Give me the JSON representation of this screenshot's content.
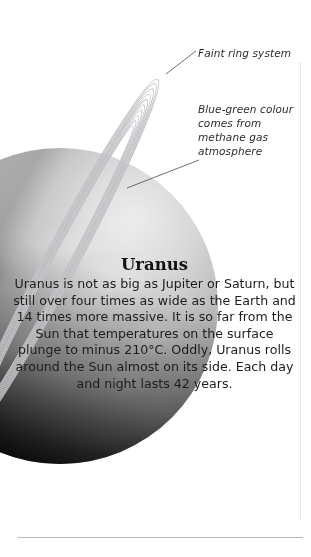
{
  "page": {
    "kind": "encyclopedia-planet-page",
    "subject": "Uranus"
  },
  "illustration": {
    "name": "uranus-planet-illustration",
    "planet_label": "Uranus planet sphere",
    "rings_label": "Uranus ring system"
  },
  "callouts": [
    {
      "id": "faint-ring-system",
      "text": "Faint ring system"
    },
    {
      "id": "blue-green-colour",
      "text": "Blue-green colour comes from methane gas atmosphere"
    }
  ],
  "article": {
    "title": "Uranus",
    "body": "Uranus is not as big as Jupiter or Saturn, but still over four times as wide as the Earth and 14 times more massive. It is so far from the Sun that temperatures on the surface plunge to minus 210°C. Oddly, Uranus rolls around the Sun almost on its side. Each day and night lasts 42 years."
  },
  "colors": {
    "page_background": "#ffffff",
    "text": "#1d1d1d",
    "title": "#111111",
    "callout_text": "#2c2c2c",
    "rule": "#b9b9bd",
    "border": "#e3e3e3",
    "ring": "#c2c2c6"
  }
}
